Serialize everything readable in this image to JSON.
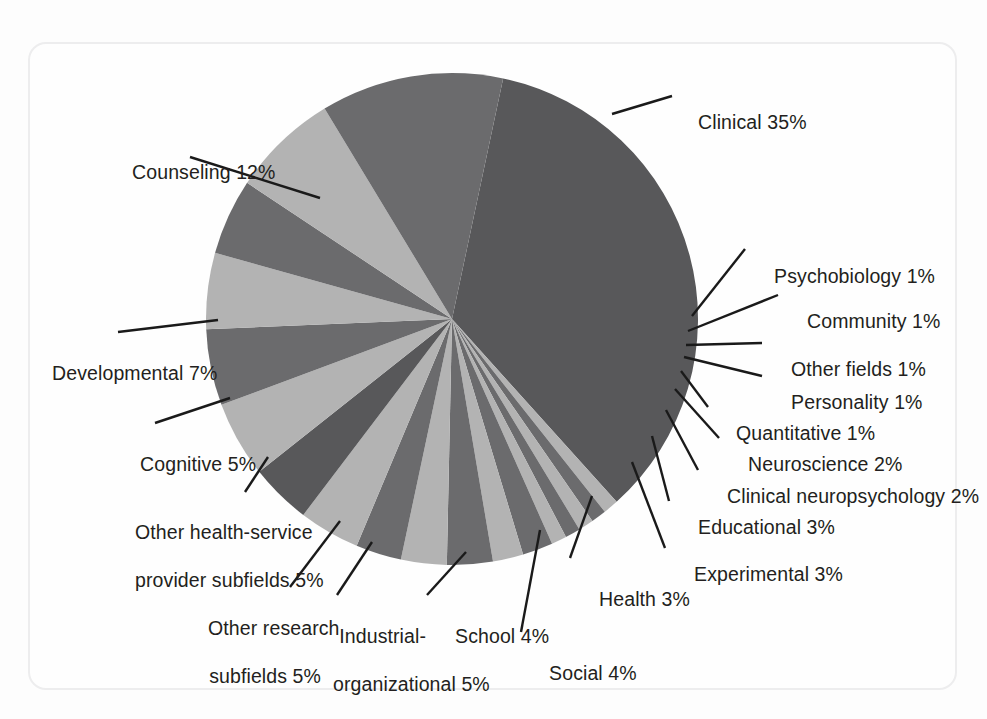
{
  "figure": {
    "background_color": "#fdfdfd",
    "frame_color": "#ededee",
    "label_text_color": "#231f20",
    "leader_line_color": "#1a1a1a"
  },
  "chart_data": {
    "type": "pie",
    "title": "",
    "xlabel": "",
    "ylabel": "",
    "legend_position": "none",
    "grid": false,
    "units": "percent",
    "start_angle_deg": -78,
    "direction": "clockwise",
    "center": {
      "x": 452,
      "y": 319
    },
    "radius": 246,
    "categories": [
      "Clinical",
      "Psychobiology",
      "Community",
      "Other fields",
      "Personality",
      "Quantitative",
      "Neuroscience",
      "Clinical neuropsychology",
      "Educational",
      "Experimental",
      "Health",
      "Social",
      "School",
      "Industrial-organizational",
      "Other research subfields",
      "Other health-service provider subfields",
      "Cognitive",
      "Developmental",
      "Counseling"
    ],
    "values": [
      35,
      1,
      1,
      1,
      1,
      1,
      2,
      2,
      3,
      3,
      3,
      4,
      4,
      5,
      5,
      5,
      5,
      7,
      12
    ],
    "colors": [
      "#58585a",
      "#b3b3b3",
      "#6b6b6d",
      "#b3b3b3",
      "#6b6b6d",
      "#b3b3b3",
      "#6b6b6d",
      "#b3b3b3",
      "#6b6b6d",
      "#b3b3b3",
      "#6b6b6d",
      "#b3b3b3",
      "#58585a",
      "#b3b3b3",
      "#6b6b6d",
      "#b3b3b3",
      "#6b6b6d",
      "#b3b3b3",
      "#6b6b6d"
    ],
    "slice_labels": [
      "Clinical 35%",
      "Psychobiology 1%",
      "Community 1%",
      "Other fields 1%",
      "Personality 1%",
      "Quantitative 1%",
      "Neuroscience 2%",
      "Clinical neuropsychology 2%",
      "Educational 3%",
      "Experimental 3%",
      "Health 3%",
      "Social 4%",
      "School 4%",
      "Industrial-organizational 5%",
      "Other research subfields 5%",
      "Other health-service provider subfields 5%",
      "Cognitive 5%",
      "Developmental 7%",
      "Counseling 12%"
    ]
  },
  "labels": [
    {
      "name": "clinical",
      "line1": "Clinical 35%",
      "line2": ""
    },
    {
      "name": "psychobiology",
      "line1": "Psychobiology 1%",
      "line2": ""
    },
    {
      "name": "community",
      "line1": "Community 1%",
      "line2": ""
    },
    {
      "name": "other-fields",
      "line1": "Other fields 1%",
      "line2": ""
    },
    {
      "name": "personality",
      "line1": "Personality 1%",
      "line2": ""
    },
    {
      "name": "quantitative",
      "line1": "Quantitative 1%",
      "line2": ""
    },
    {
      "name": "neuroscience",
      "line1": "Neuroscience 2%",
      "line2": ""
    },
    {
      "name": "clinical-neuro",
      "line1": "Clinical neuropsychology 2%",
      "line2": ""
    },
    {
      "name": "educational",
      "line1": "Educational 3%",
      "line2": ""
    },
    {
      "name": "experimental",
      "line1": "Experimental 3%",
      "line2": ""
    },
    {
      "name": "health",
      "line1": "Health 3%",
      "line2": ""
    },
    {
      "name": "social",
      "line1": "Social 4%",
      "line2": ""
    },
    {
      "name": "school",
      "line1": "School 4%",
      "line2": ""
    },
    {
      "name": "industrial",
      "line1": "Industrial-",
      "line2": "organizational 5%"
    },
    {
      "name": "other-research",
      "line1": "Other research",
      "line2": "subfields 5%"
    },
    {
      "name": "other-hsp",
      "line1": "Other health-service",
      "line2": "provider subfields 5%"
    },
    {
      "name": "cognitive",
      "line1": "Cognitive 5%",
      "line2": ""
    },
    {
      "name": "developmental",
      "line1": "Developmental 7%",
      "line2": ""
    },
    {
      "name": "counseling",
      "line1": "Counseling 12%",
      "line2": ""
    }
  ]
}
